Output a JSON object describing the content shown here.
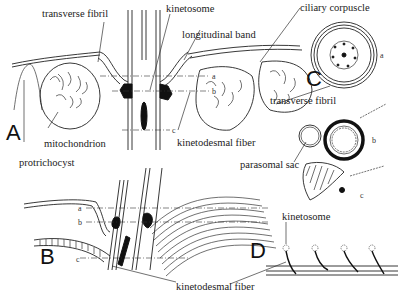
{
  "figure": {
    "panels": [
      {
        "id": "A",
        "label": "A"
      },
      {
        "id": "B",
        "label": "B"
      },
      {
        "id": "C",
        "label": "C"
      },
      {
        "id": "D",
        "label": "D"
      }
    ],
    "labels": {
      "transverse_fibril_top": "transverse fibril",
      "kinetosome_top": "kinetosome",
      "ciliary_corpuscle": "ciliary corpuscle",
      "longitudinal_band": "longitudinal band",
      "mitochondrion": "mitochondrion",
      "kinetodesmal_fiber_a": "kinetodesmal fiber",
      "protrichocyst": "protrichocyst",
      "transverse_fibril_c": "transverse fibril",
      "parasomal_sac": "parasomal sac",
      "kinetodesmal_fiber_b": "kinetodesmal fiber",
      "kinetosome_d": "kinetosome"
    },
    "section_markers": {
      "a": "a",
      "b": "b",
      "c": "c"
    }
  }
}
